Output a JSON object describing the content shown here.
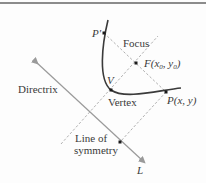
{
  "diagram": {
    "type": "parabola-definition",
    "colors": {
      "curve": "#3a3a3a",
      "directrix": "#9a9a9a",
      "dashed": "#b0b0b0",
      "text": "#3a3a3a",
      "border": "#8c8c8c"
    },
    "labels": {
      "p_prime": "P′",
      "focus_word": "Focus",
      "focus_point": "F(x",
      "focus_sub0": "0",
      "focus_mid": ", y",
      "focus_sub1": "0",
      "focus_close": ")",
      "vertex_letter": "V",
      "vertex_word": "Vertex",
      "point_p": "P(x, y)",
      "directrix": "Directrix",
      "line_of": "Line of",
      "symmetry": "symmetry",
      "line_l": "L"
    }
  }
}
